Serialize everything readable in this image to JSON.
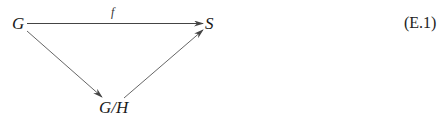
{
  "diagram": {
    "nodes": [
      {
        "id": "G",
        "label": "G"
      },
      {
        "id": "S",
        "label": "S"
      },
      {
        "id": "GH",
        "label": "G/H"
      }
    ],
    "edges": [
      {
        "from": "G",
        "to": "S",
        "label": "f"
      },
      {
        "from": "G",
        "to": "G/H",
        "label": ""
      },
      {
        "from": "G/H",
        "to": "S",
        "label": ""
      }
    ],
    "equation_number": "(E.1)"
  }
}
